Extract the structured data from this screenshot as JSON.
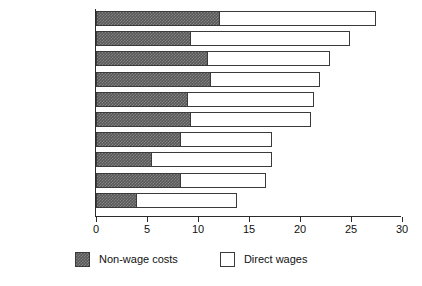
{
  "chart_data": {
    "type": "bar",
    "orientation": "horizontal",
    "stacked": true,
    "title": "",
    "subtitle": "",
    "xlabel": "",
    "ylabel": "",
    "xlim": [
      0,
      30
    ],
    "xticks": [
      0,
      5,
      10,
      15,
      20,
      25,
      30
    ],
    "xtick_labels": [
      "0",
      "5",
      "10",
      "15",
      "20",
      "25",
      "30"
    ],
    "grid": false,
    "legend_position": "bottom",
    "categories": [
      "West Germany",
      "Switzerland",
      "Belgium",
      "Austria",
      "Japan",
      "Holland",
      "France",
      "United States",
      "Italy",
      "Britain"
    ],
    "series": [
      {
        "name": "Non-wage costs",
        "color": "#595959",
        "fill": "checker-hatch",
        "values": [
          12.1,
          9.2,
          10.9,
          11.2,
          8.9,
          9.2,
          8.2,
          5.4,
          8.2,
          3.9
        ]
      },
      {
        "name": "Direct wages",
        "color": "#ffffff",
        "fill": "solid-white",
        "values": [
          15.4,
          15.7,
          12.0,
          10.8,
          12.5,
          11.9,
          9.1,
          11.9,
          8.5,
          9.9
        ]
      }
    ],
    "totals": [
      27.5,
      24.9,
      22.9,
      22.0,
      21.4,
      21.1,
      17.3,
      17.3,
      16.7,
      13.8
    ]
  },
  "legend": {
    "items": [
      {
        "label": "Non-wage costs",
        "swatch": "dark-hatched"
      },
      {
        "label": "Direct wages",
        "swatch": "white-outline"
      }
    ]
  }
}
